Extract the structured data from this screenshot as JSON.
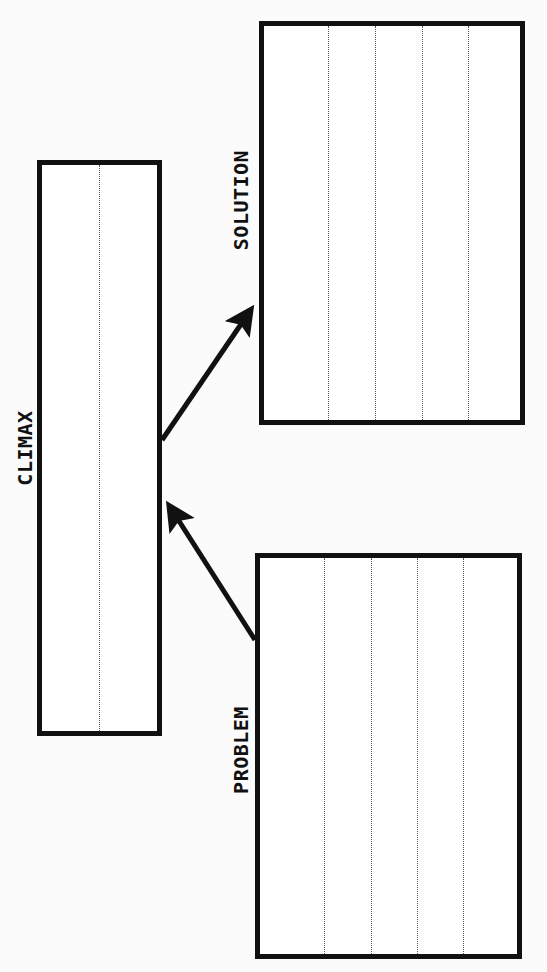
{
  "diagram": {
    "boxes": {
      "climax": {
        "label": "CLIMAX",
        "lines": 2
      },
      "solution": {
        "label": "SOLUTION",
        "lines": 5
      },
      "problem": {
        "label": "PROBLEM",
        "lines": 5
      }
    },
    "arrows": [
      {
        "from": "problem",
        "to": "climax"
      },
      {
        "from": "climax",
        "to": "solution"
      }
    ],
    "colors": {
      "stroke": "#111111",
      "background": "#fbfbfb",
      "guide_line": "#555555"
    }
  }
}
